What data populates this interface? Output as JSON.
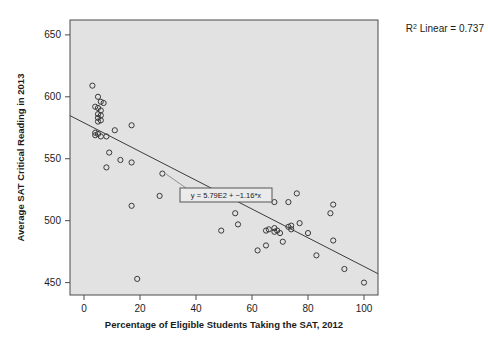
{
  "chart_data": {
    "type": "scatter",
    "title": "",
    "xlabel": "Percentage of Eligible Students Taking the SAT, 2012",
    "ylabel": "Average SAT Critical Reading in 2013",
    "xlim": [
      -5,
      105
    ],
    "ylim": [
      440,
      662
    ],
    "xticks": [
      0,
      20,
      40,
      60,
      80,
      100
    ],
    "yticks": [
      450,
      500,
      550,
      600,
      650
    ],
    "xtick_labels": [
      "0",
      "20",
      "40",
      "60",
      "80",
      "100"
    ],
    "ytick_labels": [
      "450",
      "500",
      "550",
      "600",
      "650"
    ],
    "grid": false,
    "legend": false,
    "marker_style": "open-circle",
    "annotations": {
      "r2_prefix": "R",
      "r2_exponent": "2",
      "r2_text": " Linear = 0.737",
      "r2_value": 0.737,
      "equation": "y = 5.79E2 + −1.16*x",
      "equation_intercept": 579,
      "equation_slope": -1.16
    },
    "fit_line": {
      "x": [
        -5,
        105
      ],
      "y": [
        584.8,
        457.2
      ]
    },
    "points": [
      {
        "x": 3,
        "y": 609
      },
      {
        "x": 5,
        "y": 600
      },
      {
        "x": 6,
        "y": 596
      },
      {
        "x": 7,
        "y": 595
      },
      {
        "x": 4,
        "y": 592
      },
      {
        "x": 5,
        "y": 591
      },
      {
        "x": 6,
        "y": 589
      },
      {
        "x": 5,
        "y": 586
      },
      {
        "x": 6,
        "y": 585
      },
      {
        "x": 5,
        "y": 583
      },
      {
        "x": 6,
        "y": 581
      },
      {
        "x": 5,
        "y": 580
      },
      {
        "x": 4,
        "y": 571
      },
      {
        "x": 5,
        "y": 570
      },
      {
        "x": 4,
        "y": 569
      },
      {
        "x": 6,
        "y": 568
      },
      {
        "x": 8,
        "y": 568
      },
      {
        "x": 17,
        "y": 577
      },
      {
        "x": 11,
        "y": 573
      },
      {
        "x": 9,
        "y": 555
      },
      {
        "x": 13,
        "y": 549
      },
      {
        "x": 17,
        "y": 547
      },
      {
        "x": 8,
        "y": 543
      },
      {
        "x": 28,
        "y": 538
      },
      {
        "x": 27,
        "y": 520
      },
      {
        "x": 17,
        "y": 512
      },
      {
        "x": 19,
        "y": 453
      },
      {
        "x": 49,
        "y": 492
      },
      {
        "x": 54,
        "y": 506
      },
      {
        "x": 55,
        "y": 497
      },
      {
        "x": 62,
        "y": 476
      },
      {
        "x": 65,
        "y": 492
      },
      {
        "x": 66,
        "y": 493
      },
      {
        "x": 65,
        "y": 480
      },
      {
        "x": 68,
        "y": 494
      },
      {
        "x": 68,
        "y": 491
      },
      {
        "x": 68,
        "y": 515
      },
      {
        "x": 69,
        "y": 492
      },
      {
        "x": 70,
        "y": 490
      },
      {
        "x": 71,
        "y": 483
      },
      {
        "x": 73,
        "y": 515
      },
      {
        "x": 73,
        "y": 495
      },
      {
        "x": 74,
        "y": 493
      },
      {
        "x": 74,
        "y": 496
      },
      {
        "x": 76,
        "y": 522
      },
      {
        "x": 77,
        "y": 498
      },
      {
        "x": 80,
        "y": 490
      },
      {
        "x": 83,
        "y": 472
      },
      {
        "x": 88,
        "y": 506
      },
      {
        "x": 89,
        "y": 513
      },
      {
        "x": 89,
        "y": 484
      },
      {
        "x": 93,
        "y": 461
      },
      {
        "x": 100,
        "y": 450
      }
    ]
  }
}
